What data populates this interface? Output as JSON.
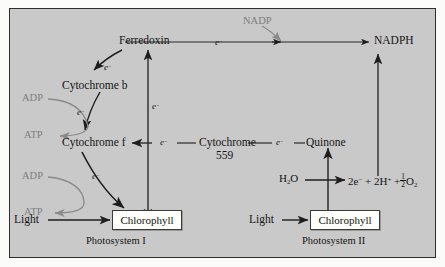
{
  "diagram": {
    "background_color": "#c9c9c9",
    "frame_color": "#2e2e2e",
    "text_color": "#141414",
    "accent_gray": "#7e7e7e",
    "box_fill": "#fdfdfa"
  },
  "nodes": {
    "ferredoxin": "Ferredoxin",
    "cytochrome_b": "Cytochrome b",
    "cytochrome_f": "Cytochrome f",
    "cytochrome_559_line1": "Cytochrome",
    "cytochrome_559_line2": "559",
    "quinone": "Quinone",
    "nadp": "NADP",
    "nadph": "NADPH",
    "chlorophyll_ps1": "Chlorophyll",
    "chlorophyll_ps2": "Chlorophyll"
  },
  "cofactors": {
    "adp_ps1": "ADP",
    "atp_ps1": "ATP",
    "adp_cytb": "ADP",
    "atp_cytb": "ATP"
  },
  "inputs": {
    "light_ps1": "Light",
    "light_ps2": "Light"
  },
  "water_split": {
    "reactant": "H",
    "reactant_sub": "2",
    "reactant_tail": "O",
    "products_electrons": "2e",
    "products_protons": "2H",
    "products_oxygen": "O",
    "oxygen_sub": "2",
    "fraction_numerator": "1",
    "fraction_denominator": "2",
    "plus_one": "+",
    "plus_two": "+"
  },
  "electron_labels": {
    "e_fd_to_cytb": "e",
    "e_cytb_to_cytf": "e",
    "e_cytf_to_chl": "e",
    "e_vertical_ps1": "e",
    "e_top_to_nadph": "e",
    "e_cytf_chain": "e",
    "e_quinone_chain": "e",
    "superscript": "−"
  },
  "captions": {
    "photosystem_1": "Photosystem I",
    "photosystem_2": "Photosystem II"
  }
}
